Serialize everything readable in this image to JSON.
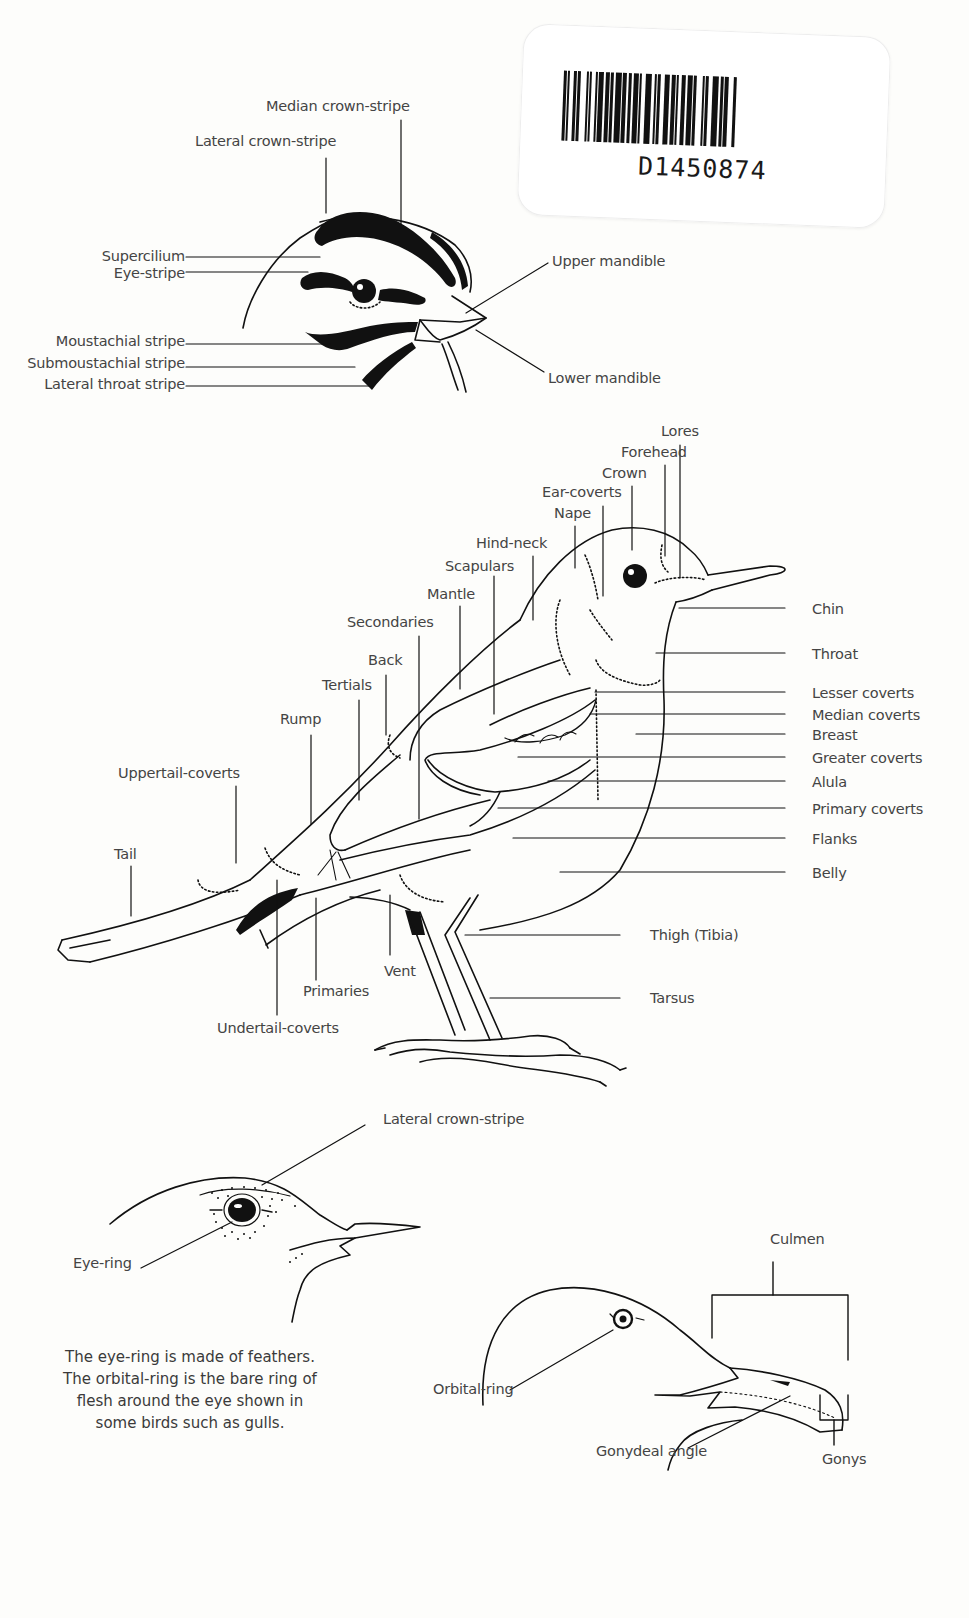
{
  "barcode": {
    "number": "D1450874",
    "bars": [
      3,
      1,
      2,
      4,
      3,
      1,
      3,
      6,
      2,
      1,
      2,
      4,
      2,
      1,
      5,
      2,
      4,
      1,
      3,
      2,
      6,
      1,
      4,
      2,
      3,
      2,
      5,
      1,
      2,
      4,
      6,
      3,
      2,
      1,
      3,
      4,
      5,
      2,
      4,
      1,
      2,
      3,
      4,
      2,
      5,
      1,
      3,
      6,
      2,
      1,
      3,
      4,
      6,
      2,
      3,
      1,
      4,
      5,
      3,
      2
    ]
  },
  "head_diagram_1": {
    "labels": {
      "median_crown_stripe": "Median crown-stripe",
      "lateral_crown_stripe": "Lateral crown-stripe",
      "supercilium": "Supercilium",
      "eye_stripe": "Eye-stripe",
      "moustachial_stripe": "Moustachial stripe",
      "submoustachial_stripe": "Submoustachial stripe",
      "lateral_throat_stripe": "Lateral throat stripe",
      "upper_mandible": "Upper mandible",
      "lower_mandible": "Lower mandible"
    }
  },
  "body_diagram": {
    "labels": {
      "lores": "Lores",
      "forehead": "Forehead",
      "crown": "Crown",
      "ear_coverts": "Ear-coverts",
      "nape": "Nape",
      "hind_neck": "Hind-neck",
      "scapulars": "Scapulars",
      "mantle": "Mantle",
      "secondaries": "Secondaries",
      "back": "Back",
      "tertials": "Tertials",
      "rump": "Rump",
      "uppertail_coverts": "Uppertail-coverts",
      "tail": "Tail",
      "chin": "Chin",
      "throat": "Throat",
      "lesser_coverts": "Lesser coverts",
      "median_coverts": "Median coverts",
      "breast": "Breast",
      "greater_coverts": "Greater coverts",
      "alula": "Alula",
      "primary_coverts": "Primary coverts",
      "flanks": "Flanks",
      "belly": "Belly",
      "thigh": "Thigh (Tibia)",
      "tarsus": "Tarsus",
      "vent": "Vent",
      "primaries": "Primaries",
      "undertail_coverts": "Undertail-coverts"
    }
  },
  "head_diagram_2": {
    "labels": {
      "lateral_crown_stripe": "Lateral crown-stripe",
      "eye_ring": "Eye-ring"
    },
    "caption": "The eye-ring is made of feathers. The orbital-ring is the bare ring of flesh around the eye shown in some birds such as gulls."
  },
  "head_diagram_3": {
    "labels": {
      "culmen": "Culmen",
      "orbital_ring": "Orbital-ring",
      "gonydeal_angle": "Gonydeal angle",
      "gonys": "Gonys"
    }
  }
}
